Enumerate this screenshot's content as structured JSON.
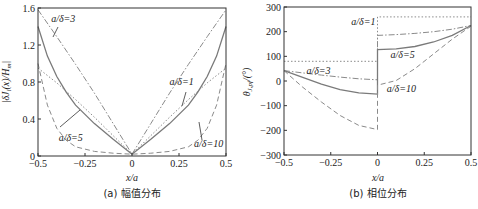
{
  "chart_data": [
    {
      "type": "line",
      "panel": "a",
      "caption": "(a) 幅值分布",
      "xlabel": "x/a",
      "ylabel": "|δJ_i(x)/H_m|",
      "xlim": [
        -0.5,
        0.5
      ],
      "ylim": [
        0,
        1.6
      ],
      "xticks": [
        -0.5,
        -0.25,
        0,
        0.25,
        0.5
      ],
      "xtick_labels": [
        "−0.5",
        "−0.25",
        "0",
        "0.25",
        "0.5"
      ],
      "yticks": [
        0,
        0.4,
        0.8,
        1.2,
        1.6
      ],
      "ytick_labels": [
        "0",
        "0.4",
        "0.8",
        "1.2",
        "1.6"
      ],
      "grid": false,
      "series": [
        {
          "name": "a/δ=1",
          "style": "dotted",
          "x": [
            -0.5,
            -0.4,
            -0.3,
            -0.2,
            -0.1,
            0,
            0.1,
            0.2,
            0.3,
            0.4,
            0.5
          ],
          "values": [
            0.95,
            0.79,
            0.61,
            0.42,
            0.22,
            0.02,
            0.22,
            0.42,
            0.61,
            0.79,
            0.95
          ]
        },
        {
          "name": "a/δ=3",
          "style": "dashdot",
          "x": [
            -0.5,
            -0.4,
            -0.3,
            -0.2,
            -0.1,
            0,
            0.1,
            0.2,
            0.3,
            0.4,
            0.5
          ],
          "values": [
            1.58,
            1.29,
            0.99,
            0.68,
            0.35,
            0.02,
            0.35,
            0.68,
            0.99,
            1.29,
            1.58
          ]
        },
        {
          "name": "a/δ=5",
          "style": "solid",
          "x": [
            -0.5,
            -0.45,
            -0.4,
            -0.35,
            -0.3,
            -0.2,
            -0.1,
            0,
            0.1,
            0.2,
            0.3,
            0.35,
            0.4,
            0.45,
            0.5
          ],
          "values": [
            1.4,
            1.08,
            0.86,
            0.69,
            0.55,
            0.35,
            0.18,
            0.02,
            0.18,
            0.35,
            0.55,
            0.69,
            0.86,
            1.08,
            1.4
          ]
        },
        {
          "name": "a/δ=10",
          "style": "dashed",
          "x": [
            -0.5,
            -0.45,
            -0.4,
            -0.35,
            -0.3,
            -0.2,
            -0.1,
            0,
            0.1,
            0.2,
            0.3,
            0.35,
            0.4,
            0.45,
            0.5
          ],
          "values": [
            1.0,
            0.55,
            0.3,
            0.17,
            0.1,
            0.05,
            0.03,
            0.02,
            0.03,
            0.05,
            0.1,
            0.17,
            0.3,
            0.55,
            1.0
          ]
        }
      ],
      "annotations": [
        {
          "text": "a/δ=3",
          "x": -0.43,
          "y": 1.45
        },
        {
          "text": "a/δ=1",
          "x": 0.2,
          "y": 0.77
        },
        {
          "text": "a/δ=5",
          "x": -0.39,
          "y": 0.16
        },
        {
          "text": "a/δ=10",
          "x": 0.33,
          "y": 0.1
        }
      ]
    },
    {
      "type": "line",
      "panel": "b",
      "caption": "(b) 相位分布",
      "xlabel": "x/a",
      "ylabel": "θ_J,pf/(°)",
      "xlim": [
        -0.5,
        0.5
      ],
      "ylim": [
        -300,
        300
      ],
      "xticks": [
        -0.5,
        -0.25,
        0,
        0.25,
        0.5
      ],
      "xtick_labels": [
        "−0.5",
        "−0.25",
        "0",
        "0.25",
        "0.5"
      ],
      "yticks": [
        -300,
        -200,
        -100,
        0,
        100,
        200,
        300
      ],
      "ytick_labels": [
        "−300",
        "−200",
        "−100",
        "0",
        "100",
        "200",
        "300"
      ],
      "grid": false,
      "series": [
        {
          "name": "a/δ=1",
          "style": "dotted",
          "x": [
            -0.5,
            -0.25,
            0,
            0,
            0.25,
            0.5
          ],
          "values": [
            80,
            80,
            80,
            260,
            260,
            260
          ]
        },
        {
          "name": "a/δ=3",
          "style": "dashdot",
          "x": [
            -0.5,
            -0.4,
            -0.3,
            -0.2,
            -0.1,
            0,
            0,
            0.1,
            0.2,
            0.3,
            0.4,
            0.5
          ],
          "values": [
            42,
            33,
            24,
            16,
            9,
            5,
            185,
            188,
            193,
            200,
            210,
            225
          ]
        },
        {
          "name": "a/δ=5",
          "style": "solid",
          "x": [
            -0.5,
            -0.4,
            -0.3,
            -0.2,
            -0.1,
            0,
            0,
            0.1,
            0.2,
            0.3,
            0.4,
            0.5
          ],
          "values": [
            42,
            15,
            -13,
            -35,
            -48,
            -53,
            127,
            130,
            140,
            158,
            185,
            225
          ]
        },
        {
          "name": "a/δ=10",
          "style": "dashed",
          "x": [
            -0.5,
            -0.4,
            -0.3,
            -0.2,
            -0.1,
            0,
            0,
            0.1,
            0.2,
            0.3,
            0.4,
            0.5
          ],
          "values": [
            42,
            -25,
            -85,
            -140,
            -180,
            -197,
            -17,
            2,
            50,
            110,
            170,
            222
          ]
        }
      ],
      "annotations": [
        {
          "text": "a/δ=1",
          "x": -0.14,
          "y": 228
        },
        {
          "text": "a/δ=5",
          "x": 0.07,
          "y": 92
        },
        {
          "text": "a/δ=3",
          "x": -0.38,
          "y": 28
        },
        {
          "text": "a/δ=10",
          "x": 0.05,
          "y": -45
        }
      ]
    }
  ],
  "captions": {
    "left": "(a) 幅值分布",
    "right": "(b) 相位分布"
  },
  "labels": {
    "left_xlabel": "x/a",
    "right_xlabel": "x/a"
  },
  "colors": {
    "axis": "#333333",
    "curve": "#8a8a8a",
    "curve_solid": "#7a7a7a"
  }
}
